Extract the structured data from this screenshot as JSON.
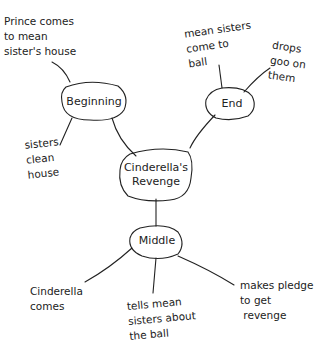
{
  "diagram": {
    "type": "mind-map",
    "center": {
      "label_line1": "Cinderella's",
      "label_line2": "Revenge"
    },
    "branches": [
      {
        "label": "Beginning",
        "leaves": [
          {
            "text": "Prince comes\nto mean\nsister's house"
          },
          {
            "text": "sisters\nclean\nhouse"
          }
        ]
      },
      {
        "label": "End",
        "leaves": [
          {
            "text": "mean sisters\ncome to\nball"
          },
          {
            "text": "drops\ngoo on\nthem"
          }
        ]
      },
      {
        "label": "Middle",
        "leaves": [
          {
            "text": "Cinderella\ncomes"
          },
          {
            "text": "tells mean\nsisters about\nthe ball"
          },
          {
            "text": "makes pledge\nto get\n revenge"
          }
        ]
      }
    ],
    "colors": {
      "stroke": "#222222",
      "background": "#ffffff"
    }
  }
}
